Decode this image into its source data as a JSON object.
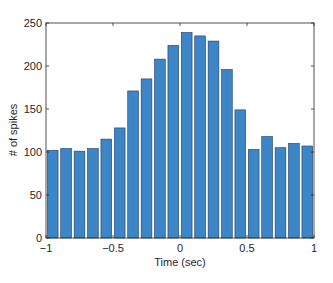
{
  "chart_data": {
    "type": "bar",
    "title": "",
    "xlabel": "Time (sec)",
    "ylabel": "# of spikes",
    "xlim": [
      -1,
      1
    ],
    "ylim": [
      0,
      250
    ],
    "bin_width": 0.1,
    "x": [
      -0.95,
      -0.85,
      -0.75,
      -0.65,
      -0.55,
      -0.45,
      -0.35,
      -0.25,
      -0.15,
      -0.05,
      0.05,
      0.15,
      0.25,
      0.35,
      0.45,
      0.55,
      0.65,
      0.75,
      0.85,
      0.95
    ],
    "values": [
      102,
      104,
      101,
      104,
      115,
      128,
      171,
      185,
      208,
      224,
      239,
      235,
      229,
      196,
      149,
      103,
      118,
      105,
      110,
      107
    ],
    "xticks": [
      -1,
      -0.5,
      0,
      0.5,
      1
    ],
    "xtick_labels": [
      "−1",
      "−0.5",
      "0",
      "0.5",
      "1"
    ],
    "yticks": [
      0,
      50,
      100,
      150,
      200,
      250
    ],
    "ytick_labels": [
      "0",
      "50",
      "100",
      "150",
      "200",
      "250"
    ],
    "grid": false,
    "legend": null,
    "colors": {
      "bar_fill": "#3c85c6",
      "bar_edge": "#1f3f66",
      "axis": "#262626"
    }
  }
}
